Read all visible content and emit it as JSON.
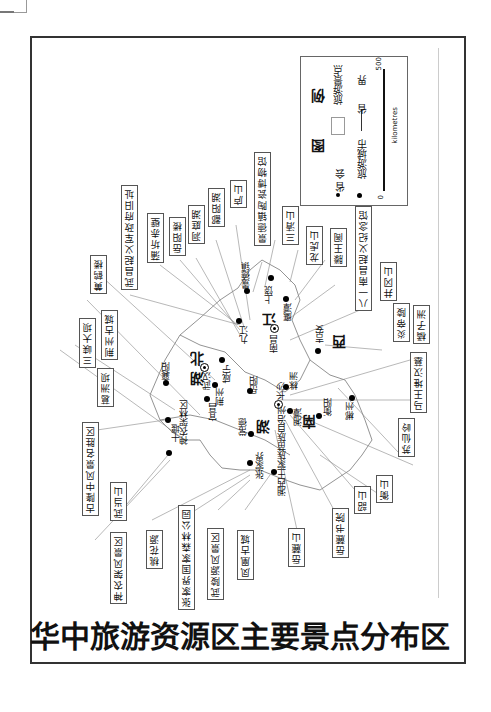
{
  "title": "华中旅游资源区主要景点分布区",
  "legend": {
    "heading_1": "图",
    "heading_2": "例",
    "provincial_capital": "省 会",
    "tourist_city": "旅游城市",
    "scenic_spot": "旅游景点",
    "provincial_boundary": "省 界",
    "scale_start": "0",
    "scale_end": "500",
    "scale_unit": "kilometres"
  },
  "provinces": {
    "hubei_1": "湖",
    "hubei_2": "北",
    "hunan_1": "湖",
    "hunan_2": "南",
    "jiangxi_1": "江",
    "jiangxi_2": "西"
  },
  "cities": {
    "wuhan": "武汉",
    "changsha": "长沙",
    "nanchang": "南昌",
    "xiangyang": "襄阳",
    "shiyan": "十堰",
    "yichang": "宜昌",
    "jingzhou": "荆州",
    "xianning": "咸宁",
    "yueyang": "岳阳",
    "changde": "常德",
    "zhangjiajie": "张家界",
    "xiangxi": "湘西土家族苗族自治州",
    "zhuzhou": "株洲",
    "xiangtan": "湘潭",
    "hengyang": "衡阳",
    "chenzhou": "郴州",
    "jiujiang": "九江",
    "jingdezhen": "景德镇",
    "shangrao": "上饶",
    "yingtan": "鹰潭",
    "jian": "吉安",
    "shennongjia": "神农架林区"
  },
  "scenic_spots": [
    {
      "id": "wuchang_uprising",
      "label": "武昌起义军政府旧址"
    },
    {
      "id": "puqi_chibi",
      "label": "蒲圻赤壁"
    },
    {
      "id": "yueyang_tower",
      "label": "岳阳楼"
    },
    {
      "id": "dongting_lake",
      "label": "洞庭湖"
    },
    {
      "id": "poyang_lake",
      "label": "鄱阳湖"
    },
    {
      "id": "lushan",
      "label": "庐山"
    },
    {
      "id": "jingdezhen_museum",
      "label": "景德镇陶瓷博物馆"
    },
    {
      "id": "sanqingshan",
      "label": "三清山"
    },
    {
      "id": "longhushan",
      "label": "龙虎山"
    },
    {
      "id": "tengwang",
      "label": "滕王阁"
    },
    {
      "id": "bayi_memorial",
      "label": "八一南昌起义纪念馆"
    },
    {
      "id": "jinggangshan",
      "label": "井冈山"
    },
    {
      "id": "yandi_ling",
      "label": "炎帝陵"
    },
    {
      "id": "juzizhou",
      "label": "橘子洲"
    },
    {
      "id": "mawangdui",
      "label": "马王堆汉墓"
    },
    {
      "id": "suxianling",
      "label": "苏仙岭"
    },
    {
      "id": "hengshan",
      "label": "衡山"
    },
    {
      "id": "shaoshan",
      "label": "韶山"
    },
    {
      "id": "yuelu_academy",
      "label": "岳麓书院"
    },
    {
      "id": "yuelushan",
      "label": "岳麓山"
    },
    {
      "id": "fenghuang",
      "label": "凤凰古城"
    },
    {
      "id": "wulingyuan",
      "label": "武陵源风景区"
    },
    {
      "id": "zjj_forest",
      "label": "张家界国家森林公园"
    },
    {
      "id": "taohuayuan",
      "label": "桃花源"
    },
    {
      "id": "snj_scenic",
      "label": "神农架风景区"
    },
    {
      "id": "wudangshan",
      "label": "武当山"
    },
    {
      "id": "gulongzhong",
      "label": "古隆中风景名胜区"
    },
    {
      "id": "gezhouba",
      "label": "葛洲坝"
    },
    {
      "id": "three_gorges",
      "label": "三峡大坝"
    },
    {
      "id": "jingzhou_old",
      "label": "荆州古城"
    },
    {
      "id": "yellow_crane",
      "label": "黄鹤楼"
    }
  ]
}
